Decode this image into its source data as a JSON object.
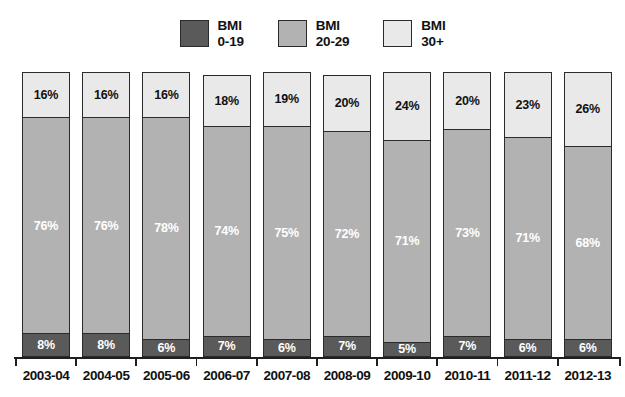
{
  "legend": {
    "items": [
      {
        "label": "BMI\n0-19",
        "color": "#5a5a5a",
        "name": "legend-swatch-bmi-0-19"
      },
      {
        "label": "BMI\n20-29",
        "color": "#b2b2b2",
        "name": "legend-swatch-bmi-20-29"
      },
      {
        "label": "BMI\n30+",
        "color": "#e9e9e9",
        "name": "legend-swatch-bmi-30-plus"
      }
    ]
  },
  "chart_data": {
    "type": "bar",
    "stacked": true,
    "title": "",
    "xlabel": "",
    "ylabel": "",
    "ylim": [
      0,
      100
    ],
    "grid": false,
    "legend_position": "top-center",
    "categories": [
      "2003-04",
      "2004-05",
      "2005-06",
      "2006-07",
      "2007-08",
      "2008-09",
      "2009-10",
      "2010-11",
      "2011-12",
      "2012-13"
    ],
    "series": [
      {
        "name": "BMI 0-19",
        "color": "#5a5a5a",
        "values": [
          8,
          8,
          6,
          7,
          6,
          7,
          5,
          7,
          6,
          6
        ],
        "labels": [
          "8%",
          "8%",
          "6%",
          "7%",
          "6%",
          "7%",
          "5%",
          "7%",
          "6%",
          "6%"
        ]
      },
      {
        "name": "BMI 20-29",
        "color": "#b2b2b2",
        "values": [
          76,
          76,
          78,
          74,
          75,
          72,
          71,
          73,
          71,
          68
        ],
        "labels": [
          "76%",
          "76%",
          "78%",
          "74%",
          "75%",
          "72%",
          "71%",
          "73%",
          "71%",
          "68%"
        ]
      },
      {
        "name": "BMI 30+",
        "color": "#e9e9e9",
        "values": [
          16,
          16,
          16,
          18,
          19,
          20,
          24,
          20,
          23,
          26
        ],
        "labels": [
          "16%",
          "16%",
          "16%",
          "18%",
          "19%",
          "20%",
          "24%",
          "20%",
          "23%",
          "26%"
        ]
      }
    ]
  }
}
